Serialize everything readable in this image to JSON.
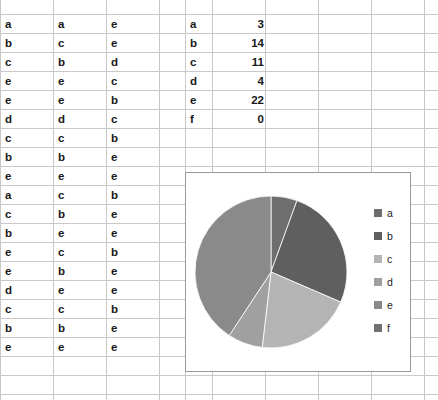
{
  "app": {
    "type": "spreadsheet-with-pie-chart"
  },
  "sheet": {
    "columns": 7,
    "data_columns": [
      {
        "name": "col-a",
        "values": [
          "a",
          "b",
          "c",
          "e",
          "e",
          "d",
          "c",
          "b",
          "e",
          "a",
          "c",
          "b",
          "e",
          "e",
          "d",
          "c",
          "b",
          "e"
        ]
      },
      {
        "name": "col-b",
        "values": [
          "a",
          "c",
          "b",
          "e",
          "e",
          "d",
          "c",
          "b",
          "e",
          "c",
          "b",
          "e",
          "c",
          "b",
          "e",
          "c",
          "b",
          "e"
        ]
      },
      {
        "name": "col-c",
        "values": [
          "e",
          "e",
          "d",
          "c",
          "b",
          "c",
          "b",
          "e",
          "e",
          "b",
          "e",
          "e",
          "b",
          "e",
          "e",
          "b",
          "e",
          "e"
        ]
      }
    ],
    "summary": {
      "labels": [
        "a",
        "b",
        "c",
        "d",
        "e",
        "f"
      ],
      "counts": [
        "3",
        "14",
        "11",
        "4",
        "22",
        "0"
      ]
    }
  },
  "chart_data": {
    "type": "pie",
    "title": "",
    "categories": [
      "a",
      "b",
      "c",
      "d",
      "e",
      "f"
    ],
    "values": [
      3,
      14,
      11,
      4,
      22,
      0
    ],
    "total": 54,
    "legend_position": "right",
    "colors": [
      "#6e6e6e",
      "#5f5f5f",
      "#b4b4b4",
      "#a0a0a0",
      "#8a8a8a",
      "#707070"
    ],
    "legend_labels": [
      "a",
      "b",
      "c",
      "d",
      "e",
      "f"
    ],
    "start_angle": 0,
    "grid": false
  }
}
